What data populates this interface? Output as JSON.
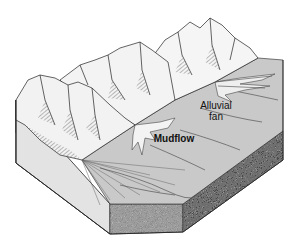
{
  "diagram": {
    "type": "geologic-block-diagram",
    "labels": {
      "alluvial_fan_line1": "Alluvial",
      "alluvial_fan_line2": "fan",
      "mudflow": "Mudflow"
    },
    "colors": {
      "background": "#ffffff",
      "valley_floor": "#c9c9c9",
      "left_side_face": "#e2e2e2",
      "gravel_face": "#8a8a8a",
      "gravel_face_dark": "#4a4a4a",
      "mountain_fill": "#f4f4f4",
      "mountain_shadow": "#9a9a9a",
      "outline": "#222222"
    }
  }
}
